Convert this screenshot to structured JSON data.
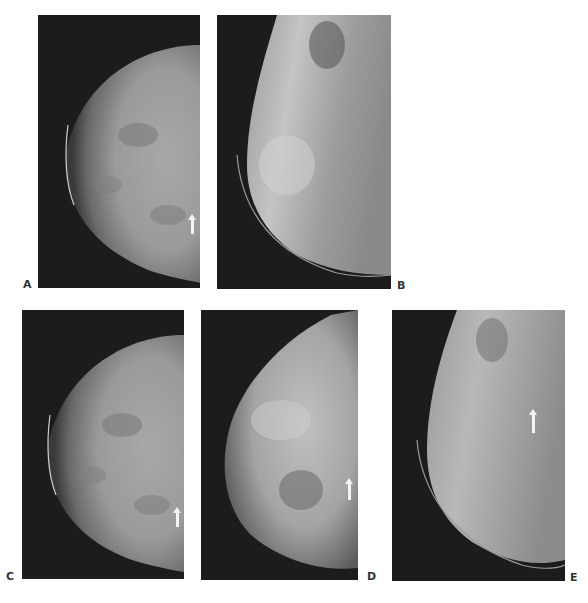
{
  "figure": {
    "panels": [
      {
        "id": "A",
        "label": "A",
        "description": "mammogram craniocaudal view, arrow lower right"
      },
      {
        "id": "B",
        "label": "B",
        "description": "mammogram mediolateral oblique view"
      },
      {
        "id": "C",
        "label": "C",
        "description": "mammogram craniocaudal view, arrow lower right"
      },
      {
        "id": "D",
        "label": "D",
        "description": "mammogram view, arrow lower right"
      },
      {
        "id": "E",
        "label": "E",
        "description": "mammogram mediolateral oblique view, arrow upper right"
      }
    ],
    "colors": {
      "background": "#ffffff",
      "panel_background": "#1c1c1c",
      "tissue": "#b8b8b8",
      "arrow": "#f4f4f4",
      "label": "#333333"
    }
  }
}
